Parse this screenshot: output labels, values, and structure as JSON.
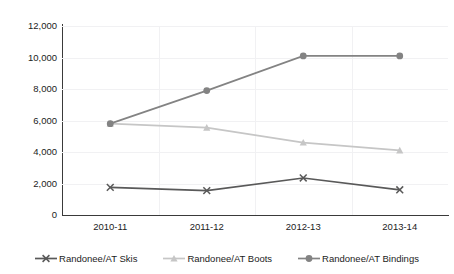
{
  "chart_data": {
    "type": "line",
    "title": "",
    "clipped_header_text": "",
    "xlabel": "",
    "ylabel": "",
    "categories": [
      "2010-11",
      "2011-12",
      "2012-13",
      "2013-14"
    ],
    "ylim": [
      0,
      12000
    ],
    "yticks": [
      0,
      2000,
      4000,
      6000,
      8000,
      10000,
      12000
    ],
    "ytick_labels": [
      "0",
      "2,000",
      "4,000",
      "6,000",
      "8,000",
      "10,000",
      "12,000"
    ],
    "grid": true,
    "legend_position": "bottom",
    "series": [
      {
        "name": "Randonee/AT Skis",
        "color": "#595959",
        "marker": "x",
        "values": [
          1750,
          1550,
          2350,
          1600
        ]
      },
      {
        "name": "Randonee/AT Boots",
        "color": "#c6c6c6",
        "marker": "triangle",
        "values": [
          5800,
          5550,
          4600,
          4100
        ]
      },
      {
        "name": "Randonee/AT Bindings",
        "color": "#838383",
        "marker": "circle",
        "values": [
          5800,
          7900,
          10100,
          10100
        ]
      }
    ]
  }
}
